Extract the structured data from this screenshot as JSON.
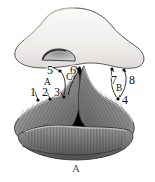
{
  "figure": {
    "caption": "A",
    "background_color": "#ffffff",
    "ink_color": "#111111",
    "palette": {
      "cap_fill": "#f2f1ef",
      "cap_outline": "#5a5a5a",
      "lobe_mid": "#8d8d8d",
      "lobe_dark": "#5e5e5e",
      "lobe_light": "#bdbdbd",
      "aperture": "#000000",
      "striation": "#4a4a4a"
    },
    "parts": {
      "cap": "dome-shaped pale structure at top",
      "slot": "small arched opening within the cap",
      "left_lobe": "striated gray fold, lower left",
      "right_lobe": "striated gray fold, lower right",
      "bottom_lobe": "striated gray fold across the base",
      "aperture": "black triangular central opening"
    },
    "labels": [
      {
        "id": "label-1",
        "text": "1",
        "type": "number",
        "x": 30,
        "y": 86,
        "dot": {
          "x": 38,
          "y": 100
        }
      },
      {
        "id": "label-2",
        "text": "2",
        "type": "number",
        "x": 42,
        "y": 86,
        "dot": {
          "x": 50,
          "y": 99
        }
      },
      {
        "id": "label-3",
        "text": "3",
        "type": "number",
        "x": 54,
        "y": 86,
        "dot": {
          "x": 64,
          "y": 97
        }
      },
      {
        "id": "label-4",
        "text": "4",
        "type": "number",
        "x": 122,
        "y": 94,
        "dot": {
          "x": 118,
          "y": 99
        }
      },
      {
        "id": "label-5",
        "text": "5",
        "type": "number",
        "x": 47,
        "y": 64,
        "dot": {
          "x": 60,
          "y": 71
        }
      },
      {
        "id": "label-6",
        "text": "6",
        "type": "number",
        "x": 70,
        "y": 64,
        "dot": {
          "x": 79,
          "y": 70
        }
      },
      {
        "id": "label-7",
        "text": "7",
        "type": "number",
        "x": 111,
        "y": 74,
        "dot": {
          "x": 112,
          "y": 69
        }
      },
      {
        "id": "label-8",
        "text": "8",
        "type": "number",
        "x": 129,
        "y": 74,
        "dot": {
          "x": 124,
          "y": 70
        }
      },
      {
        "id": "label-a",
        "text": "A",
        "type": "letter",
        "x": 44,
        "y": 78
      },
      {
        "id": "label-b",
        "text": "B",
        "type": "letter",
        "x": 116,
        "y": 84
      },
      {
        "id": "label-c",
        "text": "C",
        "type": "letter",
        "x": 66,
        "y": 73
      }
    ]
  }
}
